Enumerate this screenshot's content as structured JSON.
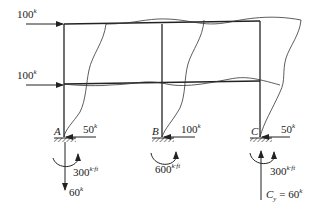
{
  "loads": {
    "top": {
      "value": "100",
      "unit": "k"
    },
    "mid": {
      "value": "100",
      "unit": "k"
    }
  },
  "supports": [
    {
      "label": "A",
      "horizontal": {
        "value": "50",
        "unit": "k"
      },
      "moment": {
        "value": "300",
        "unit": "k·ft"
      },
      "vertical": {
        "value": "60",
        "unit": "k"
      }
    },
    {
      "label": "B",
      "horizontal": {
        "value": "100",
        "unit": "k"
      },
      "moment": {
        "value": "600",
        "unit": "k·ft"
      }
    },
    {
      "label": "C",
      "horizontal": {
        "value": "50",
        "unit": "k"
      },
      "moment": {
        "value": "300",
        "unit": "k·ft"
      },
      "vertical": {
        "prefix": "C",
        "sub": "y",
        "eq": " = ",
        "value": "60",
        "unit": "k"
      }
    }
  ]
}
